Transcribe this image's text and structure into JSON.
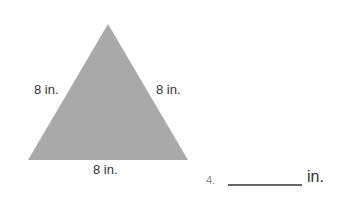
{
  "figure": {
    "shape": "equilateral-triangle",
    "fill_color": "#a9a9a9",
    "sides": {
      "left": "8 in.",
      "right": "8 in.",
      "bottom": "8 in."
    }
  },
  "question": {
    "number": "4.",
    "answer_value": "",
    "unit": "in."
  }
}
